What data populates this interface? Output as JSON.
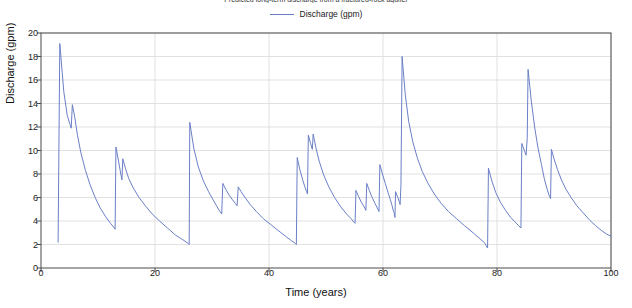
{
  "chart_data": {
    "type": "line",
    "title": "Predicted long-term discharge from a fractured-rock aquifer",
    "xlabel": "Time (years)",
    "ylabel": "Discharge (gpm)",
    "xlim": [
      0,
      100
    ],
    "ylim": [
      0,
      20
    ],
    "xticks": [
      0,
      20,
      40,
      60,
      80,
      100
    ],
    "yticks": [
      0,
      2,
      4,
      6,
      8,
      10,
      12,
      14,
      16,
      18,
      20
    ],
    "grid": true,
    "legend_position": "top-center",
    "series": [
      {
        "name": "Discharge (gpm)",
        "color": "#6b7fc7",
        "points": [
          [
            3.0,
            2.2
          ],
          [
            3.3,
            19.1
          ],
          [
            4.0,
            15.0
          ],
          [
            4.6,
            13.0
          ],
          [
            5.1,
            12.2
          ],
          [
            5.3,
            11.9
          ],
          [
            5.5,
            13.9
          ],
          [
            5.9,
            12.9
          ],
          [
            6.4,
            11.3
          ],
          [
            7.0,
            9.8
          ],
          [
            7.8,
            8.3
          ],
          [
            8.6,
            7.1
          ],
          [
            9.5,
            6.0
          ],
          [
            10.4,
            5.1
          ],
          [
            11.3,
            4.4
          ],
          [
            12.2,
            3.8
          ],
          [
            12.9,
            3.4
          ],
          [
            13.0,
            3.3
          ],
          [
            13.15,
            10.3
          ],
          [
            13.6,
            9.1
          ],
          [
            14.0,
            8.0
          ],
          [
            14.2,
            7.5
          ],
          [
            14.35,
            9.3
          ],
          [
            14.8,
            8.5
          ],
          [
            15.4,
            7.6
          ],
          [
            16.2,
            6.8
          ],
          [
            17.2,
            6.0
          ],
          [
            18.3,
            5.3
          ],
          [
            19.5,
            4.6
          ],
          [
            20.8,
            4.0
          ],
          [
            22.2,
            3.4
          ],
          [
            23.6,
            2.8
          ],
          [
            24.9,
            2.4
          ],
          [
            25.8,
            2.1
          ],
          [
            26.0,
            2.0
          ],
          [
            26.1,
            12.4
          ],
          [
            26.8,
            10.2
          ],
          [
            27.6,
            8.6
          ],
          [
            28.5,
            7.4
          ],
          [
            29.4,
            6.5
          ],
          [
            30.2,
            5.8
          ],
          [
            30.9,
            5.2
          ],
          [
            31.4,
            4.8
          ],
          [
            31.7,
            4.6
          ],
          [
            31.9,
            7.2
          ],
          [
            32.4,
            6.7
          ],
          [
            33.0,
            6.2
          ],
          [
            33.6,
            5.8
          ],
          [
            34.1,
            5.5
          ],
          [
            34.4,
            5.3
          ],
          [
            34.6,
            6.9
          ],
          [
            35.1,
            6.5
          ],
          [
            35.8,
            6.0
          ],
          [
            36.7,
            5.4
          ],
          [
            37.8,
            4.8
          ],
          [
            39.0,
            4.2
          ],
          [
            40.3,
            3.7
          ],
          [
            41.6,
            3.2
          ],
          [
            42.9,
            2.7
          ],
          [
            44.0,
            2.3
          ],
          [
            44.6,
            2.1
          ],
          [
            44.8,
            2.0
          ],
          [
            44.95,
            9.4
          ],
          [
            45.4,
            8.4
          ],
          [
            45.9,
            7.5
          ],
          [
            46.3,
            6.9
          ],
          [
            46.6,
            6.5
          ],
          [
            46.75,
            6.3
          ],
          [
            46.9,
            11.3
          ],
          [
            47.3,
            10.6
          ],
          [
            47.6,
            10.1
          ],
          [
            47.75,
            11.4
          ],
          [
            48.2,
            10.3
          ],
          [
            48.8,
            9.1
          ],
          [
            49.6,
            7.9
          ],
          [
            50.5,
            6.9
          ],
          [
            51.5,
            6.0
          ],
          [
            52.6,
            5.2
          ],
          [
            53.6,
            4.6
          ],
          [
            54.4,
            4.2
          ],
          [
            54.9,
            3.9
          ],
          [
            55.1,
            3.8
          ],
          [
            55.25,
            6.6
          ],
          [
            55.7,
            6.1
          ],
          [
            56.2,
            5.6
          ],
          [
            56.7,
            5.2
          ],
          [
            57.0,
            4.9
          ],
          [
            57.15,
            7.2
          ],
          [
            57.6,
            6.6
          ],
          [
            58.1,
            6.0
          ],
          [
            58.6,
            5.5
          ],
          [
            59.0,
            5.1
          ],
          [
            59.3,
            4.8
          ],
          [
            59.45,
            8.8
          ],
          [
            59.9,
            8.0
          ],
          [
            60.4,
            7.2
          ],
          [
            60.9,
            6.4
          ],
          [
            61.3,
            5.8
          ],
          [
            61.6,
            5.3
          ],
          [
            61.8,
            4.9
          ],
          [
            61.95,
            4.7
          ],
          [
            62.1,
            4.3
          ],
          [
            62.2,
            6.5
          ],
          [
            62.6,
            6.0
          ],
          [
            62.9,
            5.6
          ],
          [
            63.0,
            5.4
          ],
          [
            63.15,
            7.0
          ],
          [
            63.35,
            18.0
          ],
          [
            63.9,
            14.8
          ],
          [
            64.5,
            12.5
          ],
          [
            65.2,
            10.8
          ],
          [
            66.0,
            9.4
          ],
          [
            66.9,
            8.2
          ],
          [
            67.9,
            7.2
          ],
          [
            69.0,
            6.3
          ],
          [
            70.2,
            5.5
          ],
          [
            71.5,
            4.8
          ],
          [
            72.9,
            4.2
          ],
          [
            74.3,
            3.6
          ],
          [
            75.8,
            3.0
          ],
          [
            77.0,
            2.5
          ],
          [
            77.9,
            2.1
          ],
          [
            78.2,
            1.8
          ],
          [
            78.35,
            1.7
          ],
          [
            78.5,
            8.5
          ],
          [
            79.1,
            7.4
          ],
          [
            79.8,
            6.4
          ],
          [
            80.6,
            5.6
          ],
          [
            81.5,
            4.9
          ],
          [
            82.4,
            4.3
          ],
          [
            83.2,
            3.9
          ],
          [
            83.8,
            3.6
          ],
          [
            84.2,
            3.4
          ],
          [
            84.35,
            10.6
          ],
          [
            84.8,
            10.0
          ],
          [
            85.1,
            9.6
          ],
          [
            85.3,
            11.0
          ],
          [
            85.45,
            16.9
          ],
          [
            86.0,
            14.3
          ],
          [
            86.6,
            12.0
          ],
          [
            87.2,
            10.2
          ],
          [
            87.8,
            8.8
          ],
          [
            88.3,
            7.6
          ],
          [
            88.8,
            6.7
          ],
          [
            89.2,
            6.1
          ],
          [
            89.4,
            5.9
          ],
          [
            89.55,
            10.1
          ],
          [
            90.0,
            9.3
          ],
          [
            90.6,
            8.4
          ],
          [
            91.3,
            7.5
          ],
          [
            92.1,
            6.7
          ],
          [
            93.0,
            6.0
          ],
          [
            94.0,
            5.3
          ],
          [
            95.1,
            4.7
          ],
          [
            96.2,
            4.1
          ],
          [
            97.3,
            3.6
          ],
          [
            98.3,
            3.2
          ],
          [
            99.2,
            2.9
          ],
          [
            100.0,
            2.7
          ]
        ]
      }
    ]
  },
  "axis": {
    "x_label": "Time (years)",
    "y_label": "Discharge (gpm)",
    "x_tick_labels": [
      "0",
      "20",
      "40",
      "60",
      "80",
      "100"
    ],
    "y_tick_labels": [
      "0",
      "2",
      "4",
      "6",
      "8",
      "10",
      "12",
      "14",
      "16",
      "18",
      "20"
    ]
  },
  "legend": {
    "entries": [
      {
        "label": "Discharge (gpm)",
        "color": "#6b7fc7"
      }
    ]
  },
  "title": "Predicted long-term discharge from a fractured-rock aquifer",
  "colors": {
    "line": "#6b7fc7",
    "grid": "#d9d9d9",
    "axis": "#4a4a4a",
    "text": "#222222"
  }
}
